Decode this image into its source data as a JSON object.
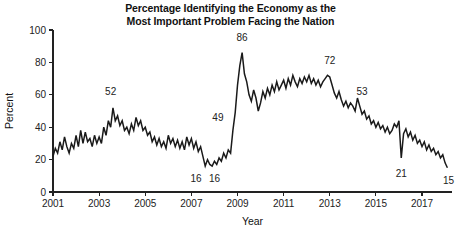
{
  "figure": {
    "title": "Percentage Identifying the Economy as the\nMost Important Problem Facing the Nation",
    "background_color": "#ffffff",
    "line_color": "#1a1a1a",
    "axis_color": "#222222"
  },
  "chart_data": {
    "type": "line",
    "title": "Percentage Identifying the Economy as the Most Important Problem Facing the Nation",
    "xlabel": "Year",
    "ylabel": "Percent",
    "xlim": [
      2001,
      2018.3
    ],
    "ylim": [
      0,
      100
    ],
    "grid": false,
    "legend": null,
    "xticks": [
      2001,
      2003,
      2005,
      2007,
      2009,
      2011,
      2013,
      2015,
      2017
    ],
    "xticklabels": [
      "2001",
      "2003",
      "2005",
      "2007",
      "2009",
      "2011",
      "2013",
      "2015",
      "2017"
    ],
    "yticks": [
      0,
      20,
      40,
      60,
      80,
      100
    ],
    "yticklabels": [
      "0",
      "20",
      "40",
      "60",
      "80",
      "100"
    ],
    "annotations": [
      {
        "label": "52",
        "x": 2003.55,
        "y": 52,
        "label_x": 2003.5,
        "label_y": 60
      },
      {
        "label": "16",
        "x": 2007.35,
        "y": 16,
        "label_x": 2007.2,
        "label_y": 6
      },
      {
        "label": "16",
        "x": 2007.95,
        "y": 16,
        "label_x": 2008.0,
        "label_y": 6
      },
      {
        "label": "49",
        "x": 2008.65,
        "y": 49,
        "label_x": 2008.15,
        "label_y": 44
      },
      {
        "label": "86",
        "x": 2009.2,
        "y": 86,
        "label_x": 2009.2,
        "label_y": 93
      },
      {
        "label": "72",
        "x": 2012.95,
        "y": 72,
        "label_x": 2013.0,
        "label_y": 79
      },
      {
        "label": "53",
        "x": 2014.35,
        "y": 53,
        "label_x": 2014.4,
        "label_y": 60
      },
      {
        "label": "21",
        "x": 2016.1,
        "y": 21,
        "label_x": 2016.1,
        "label_y": 9
      },
      {
        "label": "15",
        "x": 2018.1,
        "y": 15,
        "label_x": 2018.15,
        "label_y": 5
      }
    ],
    "series": [
      {
        "name": "Economy as most important problem",
        "color": "#1a1a1a",
        "x": [
          2001.0,
          2001.1,
          2001.2,
          2001.3,
          2001.4,
          2001.5,
          2001.6,
          2001.7,
          2001.8,
          2001.9,
          2002.0,
          2002.1,
          2002.2,
          2002.3,
          2002.4,
          2002.5,
          2002.6,
          2002.7,
          2002.8,
          2002.9,
          2003.0,
          2003.1,
          2003.2,
          2003.3,
          2003.4,
          2003.5,
          2003.6,
          2003.7,
          2003.8,
          2003.9,
          2004.0,
          2004.1,
          2004.2,
          2004.3,
          2004.4,
          2004.5,
          2004.6,
          2004.7,
          2004.8,
          2004.9,
          2005.0,
          2005.1,
          2005.2,
          2005.3,
          2005.4,
          2005.5,
          2005.6,
          2005.7,
          2005.8,
          2005.9,
          2006.0,
          2006.1,
          2006.2,
          2006.3,
          2006.4,
          2006.5,
          2006.6,
          2006.7,
          2006.8,
          2006.9,
          2007.0,
          2007.1,
          2007.2,
          2007.3,
          2007.4,
          2007.5,
          2007.6,
          2007.7,
          2007.8,
          2007.9,
          2008.0,
          2008.1,
          2008.2,
          2008.3,
          2008.4,
          2008.5,
          2008.6,
          2008.7,
          2008.8,
          2008.9,
          2009.0,
          2009.1,
          2009.2,
          2009.3,
          2009.4,
          2009.5,
          2009.6,
          2009.7,
          2009.8,
          2009.9,
          2010.0,
          2010.1,
          2010.2,
          2010.3,
          2010.4,
          2010.5,
          2010.6,
          2010.7,
          2010.8,
          2010.9,
          2011.0,
          2011.1,
          2011.2,
          2011.3,
          2011.4,
          2011.5,
          2011.6,
          2011.7,
          2011.8,
          2011.9,
          2012.0,
          2012.1,
          2012.2,
          2012.3,
          2012.4,
          2012.5,
          2012.6,
          2012.7,
          2012.8,
          2012.9,
          2013.0,
          2013.1,
          2013.2,
          2013.3,
          2013.4,
          2013.5,
          2013.6,
          2013.7,
          2013.8,
          2013.9,
          2014.0,
          2014.1,
          2014.2,
          2014.3,
          2014.4,
          2014.5,
          2014.6,
          2014.7,
          2014.8,
          2014.9,
          2015.0,
          2015.1,
          2015.2,
          2015.3,
          2015.4,
          2015.5,
          2015.6,
          2015.7,
          2015.8,
          2015.9,
          2016.0,
          2016.1,
          2016.2,
          2016.3,
          2016.4,
          2016.5,
          2016.6,
          2016.7,
          2016.8,
          2016.9,
          2017.0,
          2017.1,
          2017.2,
          2017.3,
          2017.4,
          2017.5,
          2017.6,
          2017.7,
          2017.8,
          2017.9,
          2018.0,
          2018.1
        ],
        "y": [
          22,
          27,
          24,
          31,
          26,
          34,
          28,
          24,
          30,
          27,
          35,
          28,
          38,
          30,
          37,
          31,
          33,
          28,
          35,
          30,
          34,
          30,
          40,
          35,
          44,
          40,
          52,
          44,
          47,
          41,
          44,
          38,
          40,
          36,
          42,
          38,
          46,
          41,
          44,
          38,
          40,
          35,
          37,
          31,
          34,
          29,
          33,
          28,
          31,
          27,
          35,
          30,
          33,
          28,
          32,
          27,
          31,
          26,
          34,
          29,
          33,
          27,
          31,
          25,
          28,
          22,
          16,
          20,
          17,
          16,
          19,
          17,
          21,
          19,
          24,
          21,
          26,
          24,
          38,
          49,
          66,
          78,
          86,
          73,
          68,
          60,
          56,
          63,
          58,
          50,
          55,
          62,
          58,
          64,
          60,
          66,
          62,
          68,
          63,
          66,
          69,
          64,
          70,
          66,
          72,
          68,
          65,
          70,
          67,
          71,
          68,
          72,
          67,
          70,
          66,
          69,
          65,
          68,
          70,
          72,
          71,
          66,
          61,
          58,
          62,
          57,
          53,
          56,
          52,
          55,
          53,
          50,
          58,
          53,
          48,
          50,
          45,
          47,
          42,
          44,
          40,
          43,
          39,
          41,
          37,
          40,
          36,
          38,
          42,
          40,
          44,
          21,
          36,
          39,
          34,
          37,
          32,
          35,
          30,
          32,
          28,
          31,
          26,
          29,
          25,
          27,
          23,
          25,
          21,
          23,
          18,
          15
        ]
      }
    ]
  }
}
